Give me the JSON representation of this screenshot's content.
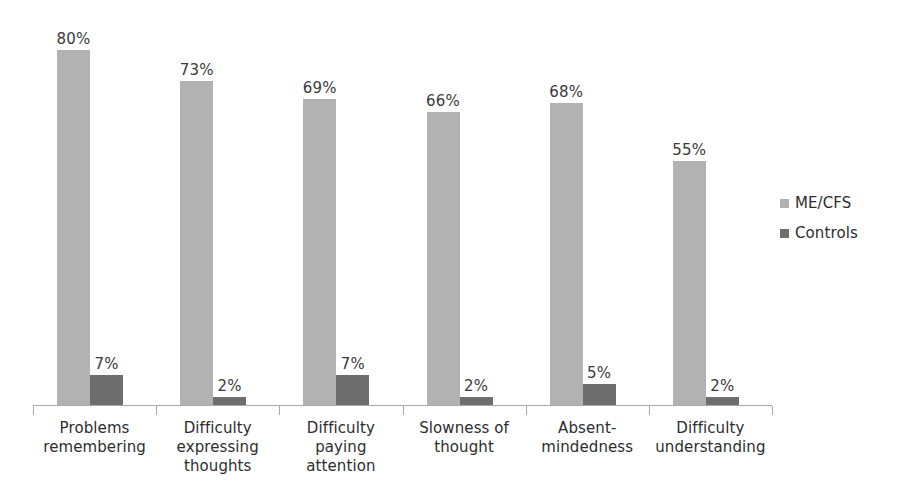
{
  "chart_data": {
    "type": "bar",
    "title": "",
    "subtitle": "",
    "xlabel": "",
    "ylabel": "",
    "ylim": [
      0,
      100
    ],
    "grid": false,
    "legend_position": "right",
    "value_suffix": "%",
    "categories": [
      "Problems\nremembering",
      "Difficulty\nexpressing\nthoughts",
      "Difficulty\npaying\nattention",
      "Slowness of\nthought",
      "Absent-\nmindedness",
      "Difficulty\nunderstanding"
    ],
    "series": [
      {
        "name": "ME/CFS",
        "color": "#b2b2b2",
        "values": [
          80,
          73,
          69,
          66,
          68,
          55
        ],
        "labels": [
          "80%",
          "73%",
          "69%",
          "66%",
          "68%",
          "55%"
        ]
      },
      {
        "name": "Controls",
        "color": "#6e6e6e",
        "values": [
          7,
          2,
          7,
          2,
          5,
          2
        ],
        "labels": [
          "7%",
          "2%",
          "7%",
          "2%",
          "5%",
          "2%"
        ]
      }
    ],
    "legend": [
      {
        "label": "ME/CFS",
        "color": "#b2b2b2"
      },
      {
        "label": "Controls",
        "color": "#6e6e6e"
      }
    ],
    "axis": {
      "baseline_color": "#a9a9a9",
      "tick_count": 7
    }
  }
}
